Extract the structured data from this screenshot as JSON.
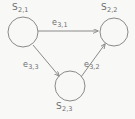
{
  "diagram": {
    "type": "directed-graph",
    "background_color": "#f8f8f7",
    "stroke_color": "#8a8a8a",
    "text_color": "#6d6d6d",
    "nodes": [
      {
        "id": "s21",
        "name": "node-s21",
        "label_base": "S",
        "label_sub": "2,1",
        "cx": 23,
        "cy": 32,
        "r": 15
      },
      {
        "id": "s22",
        "name": "node-s22",
        "label_base": "S",
        "label_sub": "2,2",
        "cx": 114,
        "cy": 32,
        "r": 14
      },
      {
        "id": "s23",
        "name": "node-s23",
        "label_base": "S",
        "label_sub": "2,3",
        "cx": 70,
        "cy": 86,
        "r": 15
      }
    ],
    "edges": [
      {
        "id": "e31",
        "name": "edge-e31",
        "from": "s21",
        "to": "s22",
        "label_base": "e",
        "label_sub": "3,1",
        "directed": true
      },
      {
        "id": "e33",
        "name": "edge-e33",
        "from": "s21",
        "to": "s23",
        "label_base": "e",
        "label_sub": "3,3",
        "directed": true
      },
      {
        "id": "e32",
        "name": "edge-e32",
        "from": "s23",
        "to": "s22",
        "label_base": "e",
        "label_sub": "3,2",
        "directed": true
      }
    ]
  }
}
